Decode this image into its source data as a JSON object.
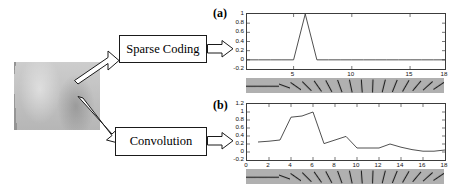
{
  "figure": {
    "input_image": {
      "name": "texture-patch",
      "description": "grayscale natural texture patch"
    },
    "pipeline": [
      {
        "id": "sparse",
        "label": "Sparse Coding"
      },
      {
        "id": "conv",
        "label": "Convolution"
      }
    ]
  },
  "panels": [
    {
      "tag": "(a)",
      "method": "Sparse Coding",
      "filters_count": 18
    },
    {
      "tag": "(b)",
      "method": "Convolution",
      "filters_count": 18
    }
  ],
  "chart_data": [
    {
      "type": "line",
      "title": "(a)",
      "xlabel": "",
      "ylabel": "",
      "x": [
        1,
        2,
        3,
        4,
        5,
        6,
        7,
        8,
        9,
        10,
        11,
        12,
        13,
        14,
        15,
        16,
        17,
        18
      ],
      "values": [
        0,
        0,
        0,
        0,
        0,
        1,
        0,
        0,
        0,
        0,
        0,
        0,
        0,
        0,
        0,
        0,
        0,
        0
      ],
      "series": [
        {
          "name": "Sparse Coding response",
          "values": [
            0,
            0,
            0,
            0,
            0,
            1,
            0,
            0,
            0,
            0,
            0,
            0,
            0,
            0,
            0,
            0,
            0,
            0
          ]
        }
      ],
      "xlim": [
        1,
        18
      ],
      "ylim": [
        -0.2,
        1.0
      ],
      "xticks": [
        5,
        10,
        15,
        18
      ],
      "xticklabels": [
        "5",
        "10",
        "15",
        "18"
      ],
      "yticks": [
        -0.2,
        0,
        0.2,
        0.4,
        0.6,
        0.8,
        1
      ],
      "yticklabels": [
        "-0.2",
        "0",
        "0.2",
        "0.4",
        "0.6",
        "0.8",
        "1"
      ],
      "grid": false,
      "legend": "none"
    },
    {
      "type": "line",
      "title": "(b)",
      "xlabel": "",
      "ylabel": "",
      "x": [
        1,
        2,
        3,
        4,
        5,
        6,
        7,
        8,
        9,
        10,
        11,
        12,
        13,
        14,
        15,
        16,
        17,
        18
      ],
      "values": [
        0.25,
        0.27,
        0.3,
        0.87,
        0.9,
        1.0,
        0.21,
        0.3,
        0.39,
        0.1,
        0.1,
        0.1,
        0.2,
        0.12,
        0.06,
        0.02,
        0.02,
        0.05
      ],
      "series": [
        {
          "name": "Convolution response",
          "values": [
            0.25,
            0.27,
            0.3,
            0.87,
            0.9,
            1.0,
            0.21,
            0.3,
            0.39,
            0.1,
            0.1,
            0.1,
            0.2,
            0.12,
            0.06,
            0.02,
            0.02,
            0.05
          ]
        }
      ],
      "xlim": [
        0,
        18
      ],
      "ylim": [
        -0.2,
        1.2
      ],
      "xticks": [
        0,
        2,
        4,
        6,
        8,
        10,
        12,
        14,
        16,
        18
      ],
      "xticklabels": [
        "0",
        "2",
        "4",
        "6",
        "8",
        "10",
        "12",
        "14",
        "16",
        "18"
      ],
      "yticks": [
        -0.2,
        0,
        0.2,
        0.4,
        0.6,
        0.8,
        1,
        1.2
      ],
      "yticklabels": [
        "-0.2",
        "0",
        "0.2",
        "0.4",
        "0.6",
        "0.8",
        "1",
        "1.2"
      ],
      "grid": false,
      "legend": "none"
    }
  ],
  "gabor_bank": {
    "name": "oriented-gabor-filters",
    "count": 18,
    "angles_deg": [
      0,
      0,
      0,
      20,
      35,
      45,
      55,
      62,
      70,
      78,
      86,
      92,
      104,
      112,
      120,
      130,
      138,
      146
    ]
  },
  "colors": {
    "line": "#3c3c3c",
    "axis": "#3c3c3c",
    "box_border": "#1a1a1a",
    "strip_background": "#b0b0b0",
    "text": "#000000"
  }
}
